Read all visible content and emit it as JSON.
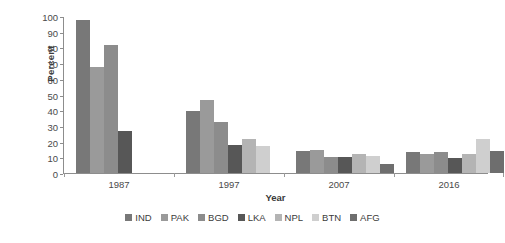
{
  "chart_data": {
    "type": "bar",
    "title": "",
    "xlabel": "Year",
    "ylabel": "Percent",
    "categories": [
      "1987",
      "1997",
      "2007",
      "2016"
    ],
    "ylim": [
      0,
      100
    ],
    "yticks": [
      "0",
      "10",
      "20",
      "30",
      "40",
      "50",
      "60",
      "70",
      "80",
      "90",
      "100"
    ],
    "grid": false,
    "legend_position": "bottom",
    "series": [
      {
        "name": "IND",
        "color": "#787878",
        "values": [
          98,
          40,
          14,
          13.5
        ]
      },
      {
        "name": "PAK",
        "color": "#9a9a9a",
        "values": [
          68,
          47,
          14.5,
          12
        ]
      },
      {
        "name": "BGD",
        "color": "#8c8c8c",
        "values": [
          82,
          33,
          10.5,
          13.5
        ]
      },
      {
        "name": "LKA",
        "color": "#575757",
        "values": [
          27,
          18,
          10.5,
          9.5
        ]
      },
      {
        "name": "NPL",
        "color": "#b4b4b4",
        "values": [
          null,
          21.5,
          12,
          12
        ]
      },
      {
        "name": "BTN",
        "color": "#cfcfcf",
        "values": [
          null,
          17.5,
          11,
          22
        ]
      },
      {
        "name": "AFG",
        "color": "#6e6e6e",
        "values": [
          null,
          null,
          6,
          14
        ]
      }
    ]
  },
  "axis": {
    "y_title": "Percent",
    "x_title": "Year"
  }
}
